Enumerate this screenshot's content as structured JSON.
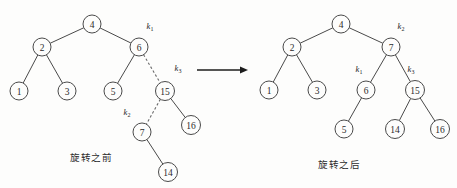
{
  "figure": {
    "background_color": "#fdfdfc",
    "node_stroke_color": "#4a4a4a",
    "dashed_edge_color": "#6a6a6a",
    "arrow_color": "#1c1c1c"
  },
  "captions": {
    "before": "旋转之前",
    "after": "旋转之后"
  },
  "arrow": {
    "name": "transformation-arrow",
    "x1": 197,
    "y1": 70,
    "x2": 248,
    "y2": 70
  },
  "diagrams": [
    {
      "id": "before",
      "caption": "旋转之前",
      "nodes": [
        {
          "id": "b4",
          "label": "4",
          "cx": 92,
          "cy": 24,
          "r": 9
        },
        {
          "id": "b2",
          "label": "2",
          "cx": 42,
          "cy": 47,
          "r": 9
        },
        {
          "id": "b6",
          "label": "6",
          "cx": 139,
          "cy": 47,
          "r": 9
        },
        {
          "id": "b1",
          "label": "1",
          "cx": 19,
          "cy": 91,
          "r": 9
        },
        {
          "id": "b3",
          "label": "3",
          "cx": 67,
          "cy": 91,
          "r": 9
        },
        {
          "id": "b5",
          "label": "5",
          "cx": 113,
          "cy": 91,
          "r": 9
        },
        {
          "id": "b15",
          "label": "15",
          "cx": 165,
          "cy": 91,
          "r": 9.5
        },
        {
          "id": "b7",
          "label": "7",
          "cx": 142,
          "cy": 132,
          "r": 9
        },
        {
          "id": "b16",
          "label": "16",
          "cx": 191,
          "cy": 125,
          "r": 9.5
        },
        {
          "id": "b14",
          "label": "14",
          "cx": 168,
          "cy": 172,
          "r": 9.5
        }
      ],
      "edges": [
        {
          "from": "b4",
          "to": "b2",
          "style": "solid"
        },
        {
          "from": "b4",
          "to": "b6",
          "style": "solid"
        },
        {
          "from": "b2",
          "to": "b1",
          "style": "solid"
        },
        {
          "from": "b2",
          "to": "b3",
          "style": "solid"
        },
        {
          "from": "b6",
          "to": "b5",
          "style": "solid"
        },
        {
          "from": "b6",
          "to": "b15",
          "style": "dashed"
        },
        {
          "from": "b15",
          "to": "b7",
          "style": "dashed"
        },
        {
          "from": "b15",
          "to": "b16",
          "style": "solid"
        },
        {
          "from": "b7",
          "to": "b14",
          "style": "solid"
        }
      ],
      "key_labels": [
        {
          "id": "bk1",
          "base": "k",
          "sub": "1",
          "x": 150,
          "y": 26
        },
        {
          "id": "bk3",
          "base": "k",
          "sub": "3",
          "x": 178,
          "y": 68
        },
        {
          "id": "bk2",
          "base": "k",
          "sub": "2",
          "x": 127,
          "y": 112
        }
      ]
    },
    {
      "id": "after",
      "caption": "旋转之后",
      "nodes": [
        {
          "id": "a4",
          "label": "4",
          "cx": 341,
          "cy": 24,
          "r": 9
        },
        {
          "id": "a2",
          "label": "2",
          "cx": 292,
          "cy": 47,
          "r": 9
        },
        {
          "id": "a7",
          "label": "7",
          "cx": 391,
          "cy": 47,
          "r": 9
        },
        {
          "id": "a1",
          "label": "1",
          "cx": 269,
          "cy": 90,
          "r": 9
        },
        {
          "id": "a3",
          "label": "3",
          "cx": 317,
          "cy": 90,
          "r": 9
        },
        {
          "id": "a6",
          "label": "6",
          "cx": 366,
          "cy": 90,
          "r": 9
        },
        {
          "id": "a15",
          "label": "15",
          "cx": 415,
          "cy": 90,
          "r": 9.5
        },
        {
          "id": "a5",
          "label": "5",
          "cx": 344,
          "cy": 129,
          "r": 9
        },
        {
          "id": "a14",
          "label": "14",
          "cx": 395,
          "cy": 129,
          "r": 9.5
        },
        {
          "id": "a16",
          "label": "16",
          "cx": 440,
          "cy": 129,
          "r": 9.5
        }
      ],
      "edges": [
        {
          "from": "a4",
          "to": "a2",
          "style": "solid"
        },
        {
          "from": "a4",
          "to": "a7",
          "style": "solid"
        },
        {
          "from": "a2",
          "to": "a1",
          "style": "solid"
        },
        {
          "from": "a2",
          "to": "a3",
          "style": "solid"
        },
        {
          "from": "a7",
          "to": "a6",
          "style": "solid"
        },
        {
          "from": "a7",
          "to": "a15",
          "style": "solid"
        },
        {
          "from": "a6",
          "to": "a5",
          "style": "solid"
        },
        {
          "from": "a15",
          "to": "a14",
          "style": "solid"
        },
        {
          "from": "a15",
          "to": "a16",
          "style": "solid"
        }
      ],
      "key_labels": [
        {
          "id": "ak2",
          "base": "k",
          "sub": "2",
          "x": 401,
          "y": 26
        },
        {
          "id": "ak1",
          "base": "k",
          "sub": "1",
          "x": 359,
          "y": 69
        },
        {
          "id": "ak3",
          "base": "k",
          "sub": "3",
          "x": 411,
          "y": 69
        }
      ]
    }
  ]
}
